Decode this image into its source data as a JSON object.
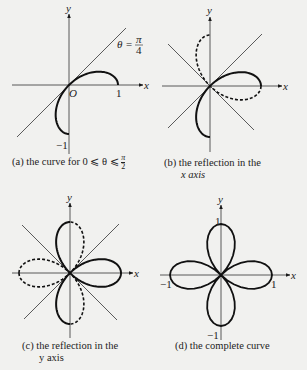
{
  "figure": {
    "curve_equation": "r = cos 2θ",
    "panels": [
      {
        "id": "a",
        "caption_prefix": "(a)",
        "caption_text": "the curve for 0 ⩽ θ ⩽ π/2",
        "caption_line1": "(a)  the curve for 0 ⩽ θ ⩽ ",
        "caption_frac_num": "π",
        "caption_frac_den": "2",
        "axis_x_label": "x",
        "axis_y_label": "y",
        "origin_label": "O",
        "tick_x": "1",
        "tick_y": "−1",
        "line_label_lhs": "θ =",
        "line_label_num": "π",
        "line_label_den": "4"
      },
      {
        "id": "b",
        "caption_line1": "(b)  the reflection in the",
        "caption_line2": "x axis",
        "axis_x_label": "x",
        "axis_y_label": "y"
      },
      {
        "id": "c",
        "caption_line1": "(c)  the reflection in the",
        "caption_line2": "y axis",
        "axis_x_label": "x",
        "axis_y_label": "y"
      },
      {
        "id": "d",
        "caption_line1": "(d)  the complete curve",
        "axis_x_label": "x",
        "axis_y_label": "y",
        "tick_x_pos": "1",
        "tick_x_neg": "−1",
        "tick_y_pos": "1",
        "tick_y_neg": "−1"
      }
    ]
  },
  "chart_data": [
    {
      "type": "line",
      "title": "(a) the curve for 0 ⩽ θ ⩽ π/2",
      "polar": "r = cos 2θ",
      "theta_range": [
        0,
        1.5708
      ],
      "lines": [
        "θ = π/4"
      ],
      "series": [
        {
          "name": "solid",
          "style": "solid",
          "theta": [
            0,
            1.5708
          ]
        }
      ],
      "xlim": [
        -1,
        1
      ],
      "ylim": [
        -1,
        1
      ]
    },
    {
      "type": "line",
      "title": "(b) the reflection in the x axis",
      "series": [
        {
          "name": "original",
          "style": "solid",
          "theta": [
            0,
            1.5708
          ]
        },
        {
          "name": "reflection in x axis",
          "style": "dashed",
          "theta": [
            -1.5708,
            0
          ]
        }
      ],
      "lines": [
        "y = x",
        "y = -x"
      ]
    },
    {
      "type": "line",
      "title": "(c) the reflection in the y axis",
      "series": [
        {
          "name": "previous",
          "style": "solid"
        },
        {
          "name": "reflection in y axis",
          "style": "dashed"
        }
      ],
      "lines": [
        "y = x",
        "y = -x"
      ]
    },
    {
      "type": "line",
      "title": "(d) the complete curve",
      "polar": "r = cos 2θ",
      "theta_range": [
        0,
        6.2832
      ],
      "series": [
        {
          "name": "four-leaf rose",
          "style": "solid"
        }
      ],
      "ticks": {
        "x": [
          -1,
          1
        ],
        "y": [
          -1,
          1
        ]
      }
    }
  ],
  "style": {
    "ink": "#1a1a1a",
    "background": "#f1f1ef"
  }
}
